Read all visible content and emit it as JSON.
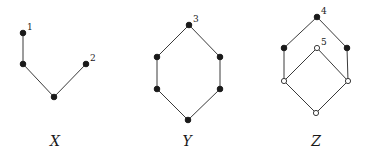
{
  "figures": [
    {
      "id": "X",
      "caption": "X",
      "caption_pos": [
        55,
        146
      ],
      "nodes": [
        {
          "id": "x1",
          "x": 23,
          "y": 33,
          "style": "filled",
          "label": "1"
        },
        {
          "id": "x_mid",
          "x": 23,
          "y": 64,
          "style": "filled",
          "label": ""
        },
        {
          "id": "x_bot",
          "x": 54,
          "y": 97,
          "style": "filled",
          "label": ""
        },
        {
          "id": "x2",
          "x": 86,
          "y": 64,
          "style": "filled",
          "label": "2"
        }
      ],
      "edges": [
        [
          "x1",
          "x_mid"
        ],
        [
          "x_mid",
          "x_bot"
        ],
        [
          "x_bot",
          "x2"
        ]
      ]
    },
    {
      "id": "Y",
      "caption": "Y",
      "caption_pos": [
        187,
        146
      ],
      "nodes": [
        {
          "id": "y3",
          "x": 189,
          "y": 25,
          "style": "filled",
          "label": "3"
        },
        {
          "id": "y_ul",
          "x": 157,
          "y": 57,
          "style": "filled",
          "label": ""
        },
        {
          "id": "y_ur",
          "x": 220,
          "y": 57,
          "style": "filled",
          "label": ""
        },
        {
          "id": "y_ll",
          "x": 157,
          "y": 89,
          "style": "filled",
          "label": ""
        },
        {
          "id": "y_lr",
          "x": 220,
          "y": 89,
          "style": "filled",
          "label": ""
        },
        {
          "id": "y_bot",
          "x": 188,
          "y": 120,
          "style": "filled",
          "label": ""
        }
      ],
      "edges": [
        [
          "y3",
          "y_ul"
        ],
        [
          "y3",
          "y_ur"
        ],
        [
          "y_ul",
          "y_ll"
        ],
        [
          "y_ur",
          "y_lr"
        ],
        [
          "y_ll",
          "y_bot"
        ],
        [
          "y_lr",
          "y_bot"
        ]
      ]
    },
    {
      "id": "Z",
      "caption": "Z",
      "caption_pos": [
        316,
        146
      ],
      "nodes": [
        {
          "id": "z4",
          "x": 317,
          "y": 17,
          "style": "filled",
          "label": "4"
        },
        {
          "id": "z_ul",
          "x": 284,
          "y": 48,
          "style": "filled",
          "label": ""
        },
        {
          "id": "z_ur",
          "x": 347,
          "y": 48,
          "style": "filled",
          "label": ""
        },
        {
          "id": "z5",
          "x": 317,
          "y": 48,
          "style": "open",
          "label": "5"
        },
        {
          "id": "z_ll",
          "x": 284,
          "y": 81,
          "style": "open",
          "label": ""
        },
        {
          "id": "z_lr",
          "x": 348,
          "y": 81,
          "style": "open",
          "label": ""
        },
        {
          "id": "z_bot",
          "x": 316,
          "y": 113,
          "style": "open",
          "label": ""
        }
      ],
      "edges": [
        [
          "z4",
          "z_ul"
        ],
        [
          "z4",
          "z_ur"
        ],
        [
          "z_ul",
          "z_ll"
        ],
        [
          "z_ur",
          "z_lr"
        ],
        [
          "z5",
          "z_ll"
        ],
        [
          "z5",
          "z_lr"
        ],
        [
          "z_ll",
          "z_bot"
        ],
        [
          "z_lr",
          "z_bot"
        ]
      ]
    }
  ],
  "colors": {
    "node_fill": "#1a1a1a",
    "edge": "#3a3a3a",
    "background": "#ffffff"
  }
}
